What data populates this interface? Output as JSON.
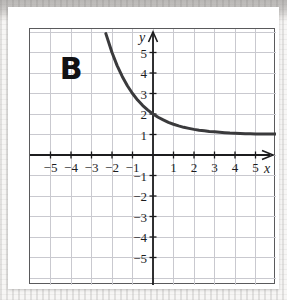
{
  "figure": {
    "panel_label": "B",
    "background_color": "#ffffff",
    "frame_color": "#5a5a5c",
    "grid_color": "#c9c9cf",
    "axis_color": "#1c1c1e",
    "curve_color": "#3a3a3c"
  },
  "axis_names": {
    "x": "x",
    "y": "y"
  },
  "chart_data": {
    "type": "line",
    "title": "B",
    "xlabel": "x",
    "ylabel": "y",
    "xlim": [
      -6.15,
      6.15
    ],
    "ylim": [
      -6.3,
      6.3
    ],
    "grid": true,
    "grid_step": 1,
    "legend": "none",
    "x_ticks": [
      -5,
      -4,
      -3,
      -2,
      -1,
      1,
      2,
      3,
      4,
      5
    ],
    "x_tick_labels": [
      "−5",
      "−4",
      "−3",
      "−2",
      "−1",
      "1",
      "2",
      "3",
      "4",
      "5"
    ],
    "y_ticks": [
      5,
      4,
      3,
      2,
      1,
      -1,
      -2,
      -3,
      -4,
      -5
    ],
    "y_tick_labels": [
      "5",
      "4",
      "3",
      "2",
      "1",
      "−1",
      "−2",
      "−3",
      "−4",
      "−5"
    ],
    "annotations": [
      {
        "text": "horizontal asymptote at y = 1",
        "y": 1
      },
      {
        "text": "y-intercept at (0, 2)",
        "x": 0,
        "y": 2
      }
    ],
    "series": [
      {
        "name": "exponential decay",
        "equation": "y = (1/2)^x + 1",
        "x": [
          -2.3,
          -2.0,
          -1.75,
          -1.5,
          -1.25,
          -1.0,
          -0.75,
          -0.5,
          -0.25,
          0.0,
          0.25,
          0.5,
          0.75,
          1.0,
          1.25,
          1.5,
          1.75,
          2.0,
          2.25,
          2.5,
          2.75,
          3.0,
          3.25,
          3.5,
          3.75,
          4.0,
          4.25,
          4.5,
          4.75,
          5.0,
          5.5,
          6.0
        ],
        "values": [
          5.92,
          5.0,
          4.36,
          3.83,
          3.38,
          3.0,
          2.68,
          2.41,
          2.19,
          2.0,
          1.84,
          1.71,
          1.59,
          1.5,
          1.42,
          1.35,
          1.3,
          1.25,
          1.21,
          1.18,
          1.15,
          1.13,
          1.11,
          1.09,
          1.07,
          1.06,
          1.05,
          1.04,
          1.04,
          1.03,
          1.02,
          1.02
        ]
      }
    ]
  }
}
